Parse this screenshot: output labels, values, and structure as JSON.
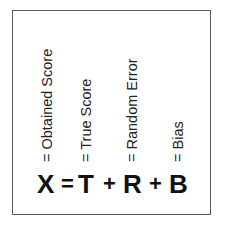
{
  "diagram": {
    "labels": [
      {
        "text": "= Obtained Score"
      },
      {
        "text": "= True Score"
      },
      {
        "text": "= Random Error"
      },
      {
        "text": "= Bias"
      }
    ],
    "equation": {
      "terms": [
        "X",
        "T",
        "R",
        "B"
      ],
      "operators": [
        "=",
        "+",
        "+"
      ]
    },
    "colors": {
      "border": "#5a5a5a",
      "text": "#111111"
    }
  }
}
